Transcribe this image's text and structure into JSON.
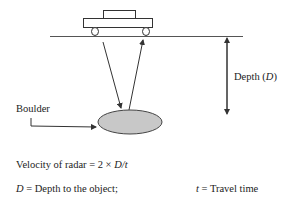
{
  "diagram": {
    "labels": {
      "depth_prefix": "Depth (",
      "depth_var": "D",
      "depth_suffix": ")",
      "boulder": "Boulder"
    },
    "formula": {
      "prefix": "Velocity of radar = ",
      "expression_num": "2 × ",
      "var_D": "D",
      "slash": "/",
      "var_t": "t"
    },
    "legend": [
      {
        "var": "D",
        "text": " = Depth to the object;"
      },
      {
        "var": "t",
        "text": " = Travel time"
      }
    ],
    "colors": {
      "line": "#333333",
      "boulder_fill": "#c8c8c8",
      "text": "#222222"
    }
  }
}
